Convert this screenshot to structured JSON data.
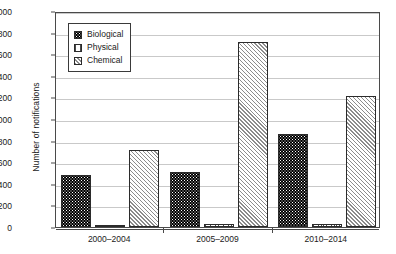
{
  "chart_data": {
    "type": "bar",
    "title": "",
    "xlabel": "",
    "ylabel": "Number of notifications",
    "categories": [
      "2000–2004",
      "2005–2009",
      "2010–2014"
    ],
    "series": [
      {
        "name": "Biological",
        "values": [
          480,
          510,
          860
        ],
        "fill": "black-dotted"
      },
      {
        "name": "Physical",
        "values": [
          10,
          25,
          25
        ],
        "fill": "white-vertical-lines"
      },
      {
        "name": "Chemical",
        "values": [
          710,
          1710,
          1210
        ],
        "fill": "gray-diagonal-hatch"
      }
    ],
    "ylim": [
      0,
      2000
    ],
    "ytick_step": 200,
    "yticks": [
      0,
      200,
      400,
      600,
      800,
      1000,
      1200,
      1400,
      1600,
      1800,
      2000
    ],
    "grid": "horizontal",
    "legend_position": "top-left-inside",
    "colors": {
      "biological": "#000000",
      "physical": "#ffffff",
      "chemical": "#f0f0f0",
      "gridline": "#c9c9c9",
      "axis": "#4a4a4a",
      "text": "#1a1a1a"
    }
  }
}
